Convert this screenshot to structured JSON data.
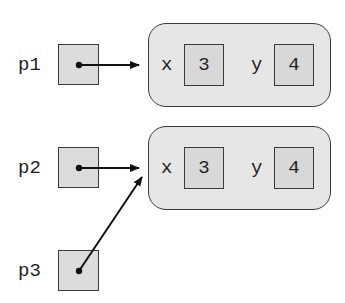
{
  "diagram": {
    "type": "object-reference-diagram",
    "colors": {
      "stroke": "#3a3a3a",
      "ref_fill": "#dcdcdc",
      "object_fill": "#e6e6e6",
      "field_fill": "#d8d8d8",
      "arrow": "#111111"
    },
    "variables": [
      {
        "name": "p1",
        "points_to": "object1"
      },
      {
        "name": "p2",
        "points_to": "object2"
      },
      {
        "name": "p3",
        "points_to": "object2"
      }
    ],
    "objects": [
      {
        "id": "object1",
        "fields": [
          {
            "name": "x",
            "value": "3"
          },
          {
            "name": "y",
            "value": "4"
          }
        ]
      },
      {
        "id": "object2",
        "fields": [
          {
            "name": "x",
            "value": "3"
          },
          {
            "name": "y",
            "value": "4"
          }
        ]
      }
    ]
  }
}
